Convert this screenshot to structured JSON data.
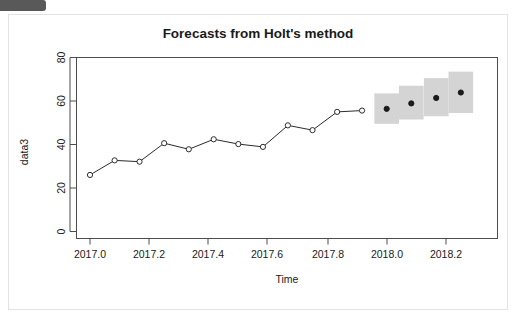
{
  "card": {
    "chip_label": ""
  },
  "chart_data": {
    "type": "line",
    "title": "Forecasts from Holt's method",
    "xlabel": "Time",
    "ylabel": "data3",
    "xlim": [
      2016.96,
      2018.33
    ],
    "ylim": [
      0,
      84
    ],
    "grid": false,
    "legend": null,
    "xticks": [
      2017.0,
      2017.2,
      2017.4,
      2017.6,
      2017.8,
      2018.0,
      2018.2
    ],
    "xtick_labels": [
      "2017.0",
      "2017.2",
      "2017.4",
      "2017.6",
      "2017.8",
      "2018.0",
      "2018.2"
    ],
    "yticks": [
      0,
      20,
      40,
      60,
      80
    ],
    "ytick_labels": [
      "0",
      "20",
      "40",
      "60",
      "80"
    ],
    "series": [
      {
        "name": "observed",
        "style": "line-open-circles",
        "x": [
          2017.0,
          2017.083,
          2017.167,
          2017.25,
          2017.333,
          2017.417,
          2017.5,
          2017.583,
          2017.667,
          2017.75,
          2017.833,
          2017.917
        ],
        "values": [
          26.0,
          32.7,
          32.1,
          40.6,
          37.8,
          42.4,
          40.2,
          38.9,
          48.8,
          46.6,
          55.0,
          55.6
        ]
      },
      {
        "name": "point forecast",
        "style": "filled-circles",
        "x": [
          2018.0,
          2018.083,
          2018.167,
          2018.25
        ],
        "values": [
          56.4,
          58.9,
          61.4,
          63.9
        ]
      }
    ],
    "prediction_intervals": [
      {
        "x": 2018.0,
        "lower": 49.5,
        "upper": 63.5
      },
      {
        "x": 2018.083,
        "lower": 51.5,
        "upper": 67.0
      },
      {
        "x": 2018.167,
        "lower": 53.0,
        "upper": 70.5
      },
      {
        "x": 2018.25,
        "lower": 54.5,
        "upper": 73.5
      }
    ],
    "colors": {
      "interval_band": "#d4d4d4",
      "line": "#2b2b2b",
      "forecast_point": "#1a1a1a",
      "axis": "#4d4d4d",
      "background": "#ffffff"
    }
  }
}
